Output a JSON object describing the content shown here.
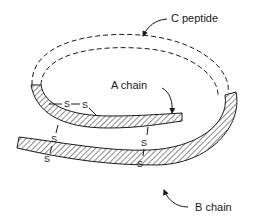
{
  "diagram": {
    "labels": {
      "c_peptide": "C peptide",
      "a_chain": "A chain",
      "b_chain": "B chain"
    },
    "disulfide": {
      "atom": "S",
      "bonds": [
        {
          "id": "intra-a",
          "between": "A chain–A chain",
          "symbols": [
            "S",
            "S"
          ]
        },
        {
          "id": "inter-left",
          "between": "A chain–B chain",
          "symbols": [
            "S",
            "S"
          ]
        },
        {
          "id": "inter-right",
          "between": "A chain–B chain",
          "symbols": [
            "S",
            "S"
          ]
        }
      ]
    },
    "colors": {
      "line": "#1a1a1a",
      "background": "#ffffff"
    }
  }
}
